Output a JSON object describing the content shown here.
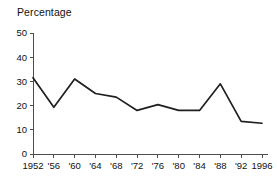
{
  "chart_data": {
    "type": "line",
    "title": "Percentage",
    "xlabel": "",
    "ylabel": "",
    "categories": [
      "1952",
      "'56",
      "'60",
      "'64",
      "'68",
      "'72",
      "'76",
      "'80",
      "'84",
      "'88",
      "'92",
      "1996"
    ],
    "x_values": [
      1952,
      1956,
      1960,
      1964,
      1968,
      1972,
      1976,
      1980,
      1984,
      1988,
      1992,
      1996
    ],
    "values": [
      31.5,
      19.3,
      31.0,
      25.0,
      23.5,
      18.0,
      20.4,
      18.0,
      18.0,
      29.0,
      13.5,
      12.7
    ],
    "ylim": [
      0,
      50
    ],
    "y_ticks": [
      0,
      10,
      20,
      30,
      40,
      50
    ],
    "y_tick_labels": [
      "0",
      "10",
      "20",
      "30",
      "40",
      "50"
    ],
    "grid": false,
    "legend": false,
    "legend_position": "none",
    "series": [
      {
        "name": "Percentage",
        "values": [
          31.5,
          19.3,
          31.0,
          25.0,
          23.5,
          18.0,
          20.4,
          18.0,
          18.0,
          29.0,
          13.5,
          12.7
        ],
        "color": "#1f1f1f"
      }
    ]
  },
  "colors": {
    "background": "#ffffff",
    "line": "#1f1f1f",
    "axis": "#4d4d4d",
    "text": "#111111"
  }
}
